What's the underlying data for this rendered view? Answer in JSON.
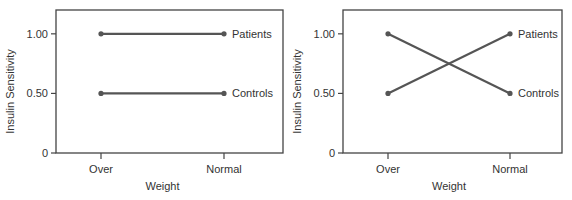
{
  "chart_data": [
    {
      "type": "line",
      "title": "",
      "xlabel": "Weight",
      "ylabel": "Insulin Sensitivity",
      "categories": [
        "Over",
        "Normal"
      ],
      "yticks": [
        0,
        0.5,
        1.0
      ],
      "ytick_labels": [
        "0",
        "0.50",
        "1.00"
      ],
      "ylim": [
        0,
        1.2
      ],
      "grid": false,
      "legend_position": "inline-right",
      "series": [
        {
          "name": "Patients",
          "values": [
            1.0,
            1.0
          ]
        },
        {
          "name": "Controls",
          "values": [
            0.5,
            0.5
          ]
        }
      ]
    },
    {
      "type": "line",
      "title": "",
      "xlabel": "Weight",
      "ylabel": "Insulin Sensitivity",
      "categories": [
        "Over",
        "Normal"
      ],
      "yticks": [
        0,
        0.5,
        1.0
      ],
      "ytick_labels": [
        "0",
        "0.50",
        "1.00"
      ],
      "ylim": [
        0,
        1.2
      ],
      "grid": false,
      "legend_position": "inline-right",
      "series": [
        {
          "name": "Patients",
          "values": [
            0.5,
            1.0
          ]
        },
        {
          "name": "Controls",
          "values": [
            1.0,
            0.5
          ]
        }
      ]
    }
  ],
  "colors": {
    "line": "#555555",
    "axis": "#444444",
    "text": "#333333"
  }
}
